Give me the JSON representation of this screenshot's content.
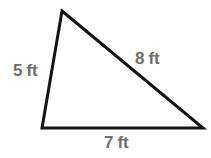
{
  "figure": {
    "kind": "triangle-diagram",
    "background_color": "#ffffff",
    "stroke_color": "#141414",
    "stroke_width": 3,
    "label_color": "#6e6e6e",
    "units": "ft",
    "vertices": {
      "apex": {
        "x": 62,
        "y": 11
      },
      "bottom_left": {
        "x": 42,
        "y": 128
      },
      "bottom_right": {
        "x": 203,
        "y": 128
      }
    },
    "sides": [
      {
        "name": "left-side",
        "label": "5 ft",
        "value": 5,
        "from": "bottom_left",
        "to": "apex"
      },
      {
        "name": "hypotenuse",
        "label": "8 ft",
        "value": 8,
        "from": "apex",
        "to": "bottom_right"
      },
      {
        "name": "base",
        "label": "7 ft",
        "value": 7,
        "from": "bottom_left",
        "to": "bottom_right"
      }
    ]
  },
  "chart_data": {
    "type": "diagram",
    "title": "",
    "shape": "triangle",
    "labels": [
      "5 ft",
      "8 ft",
      "7 ft"
    ],
    "values": [
      5,
      8,
      7
    ],
    "units": "ft"
  }
}
